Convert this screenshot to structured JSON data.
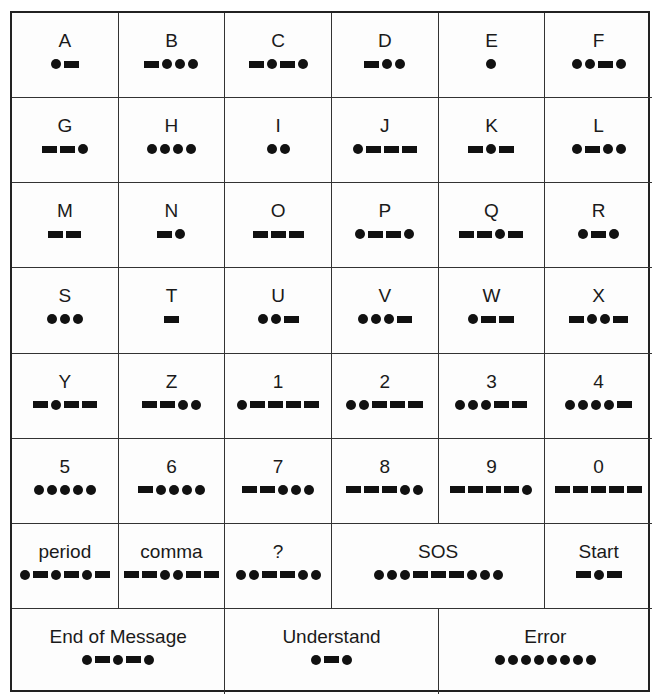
{
  "rows": [
    [
      {
        "label": "A",
        "code": ".-"
      },
      {
        "label": "B",
        "code": "-..."
      },
      {
        "label": "C",
        "code": "-.-."
      },
      {
        "label": "D",
        "code": "-.."
      },
      {
        "label": "E",
        "code": "."
      },
      {
        "label": "F",
        "code": "..-."
      }
    ],
    [
      {
        "label": "G",
        "code": "--."
      },
      {
        "label": "H",
        "code": "...."
      },
      {
        "label": "I",
        "code": ".."
      },
      {
        "label": "J",
        "code": ".---"
      },
      {
        "label": "K",
        "code": "-.-"
      },
      {
        "label": "L",
        "code": ".-.."
      }
    ],
    [
      {
        "label": "M",
        "code": "--"
      },
      {
        "label": "N",
        "code": "-."
      },
      {
        "label": "O",
        "code": "---"
      },
      {
        "label": "P",
        "code": ".--."
      },
      {
        "label": "Q",
        "code": "--.-"
      },
      {
        "label": "R",
        "code": ".-."
      }
    ],
    [
      {
        "label": "S",
        "code": "..."
      },
      {
        "label": "T",
        "code": "-"
      },
      {
        "label": "U",
        "code": "..-"
      },
      {
        "label": "V",
        "code": "...-"
      },
      {
        "label": "W",
        "code": ".--"
      },
      {
        "label": "X",
        "code": "-..-"
      }
    ],
    [
      {
        "label": "Y",
        "code": "-.--"
      },
      {
        "label": "Z",
        "code": "--.."
      },
      {
        "label": "1",
        "code": ".----"
      },
      {
        "label": "2",
        "code": "..---"
      },
      {
        "label": "3",
        "code": "...--"
      },
      {
        "label": "4",
        "code": "....-"
      }
    ],
    [
      {
        "label": "5",
        "code": "....."
      },
      {
        "label": "6",
        "code": "-...."
      },
      {
        "label": "7",
        "code": "--..."
      },
      {
        "label": "8",
        "code": "---.."
      },
      {
        "label": "9",
        "code": "----."
      },
      {
        "label": "0",
        "code": "-----"
      }
    ],
    [
      {
        "label": "period",
        "code": ".-.-.-",
        "span": 1
      },
      {
        "label": "comma",
        "code": "--..--",
        "span": 1
      },
      {
        "label": "?",
        "code": "..--..",
        "span": 1
      },
      {
        "label": "SOS",
        "code": "...---...",
        "span": 2
      },
      {
        "label": "Start",
        "code": "-.-",
        "span": 1
      }
    ],
    [
      {
        "label": "End of Message",
        "code": ".-.-.",
        "span": 2
      },
      {
        "label": "Understand",
        "code": ".-.",
        "span": 2
      },
      {
        "label": "Error",
        "code": "........",
        "span": 2
      }
    ]
  ],
  "legend": {
    "dot": "dot-symbol",
    "dash": "dash-symbol"
  }
}
